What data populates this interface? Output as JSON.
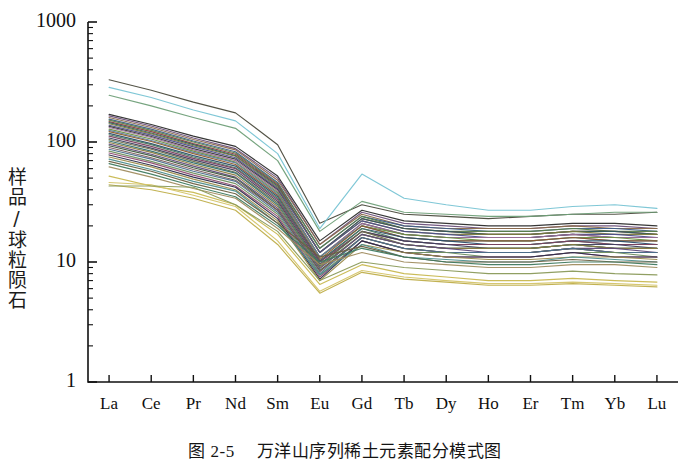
{
  "figure": {
    "caption_label": "图 2-5",
    "caption_text": "万洋山序列稀土元素配分模式图",
    "caption_full": "图 2-5　万洋山序列稀土元素配分模式图"
  },
  "chart_data": {
    "type": "line",
    "title": "",
    "xlabel": "",
    "ylabel": "样品/球粒陨石",
    "yscale": "log",
    "ylim": [
      1,
      1000
    ],
    "ytick_labels": [
      "1000",
      "100",
      "10",
      "1"
    ],
    "ytick_values": [
      1000,
      100,
      10,
      1
    ],
    "minor_ticks": true,
    "grid": false,
    "legend": "none",
    "categories": [
      "La",
      "Ce",
      "Pr",
      "Nd",
      "Sm",
      "Eu",
      "Gd",
      "Tb",
      "Dy",
      "Ho",
      "Er",
      "Tm",
      "Yb",
      "Lu"
    ],
    "series": [
      {
        "name": "S01",
        "color": "#4a4a3c",
        "values": [
          330,
          270,
          215,
          175,
          95,
          21,
          30,
          25,
          24,
          23,
          24,
          25,
          25,
          26
        ]
      },
      {
        "name": "S02",
        "color": "#78c4d4",
        "values": [
          285,
          235,
          185,
          150,
          80,
          19,
          54,
          34,
          30,
          27,
          27,
          29,
          30,
          28
        ]
      },
      {
        "name": "S03",
        "color": "#6f9f78",
        "values": [
          245,
          200,
          160,
          130,
          70,
          18,
          32,
          26,
          25,
          24,
          24,
          25,
          26,
          26
        ]
      },
      {
        "name": "S04",
        "color": "#2b2b2b",
        "values": [
          170,
          140,
          112,
          92,
          52,
          15,
          27,
          22,
          21,
          20,
          20,
          21,
          21,
          20
        ]
      },
      {
        "name": "S05",
        "color": "#6b4f7a",
        "values": [
          165,
          136,
          108,
          88,
          50,
          14,
          26,
          21,
          20,
          19,
          19,
          20,
          20,
          19
        ]
      },
      {
        "name": "S06",
        "color": "#8a6a4a",
        "values": [
          160,
          132,
          105,
          86,
          48,
          14,
          25,
          20,
          19,
          19,
          19,
          20,
          19,
          19
        ]
      },
      {
        "name": "S07",
        "color": "#3f5e8c",
        "values": [
          155,
          128,
          102,
          83,
          46,
          13,
          24,
          20,
          19,
          18,
          18,
          19,
          19,
          18
        ]
      },
      {
        "name": "S08",
        "color": "#5a7f4a",
        "values": [
          152,
          125,
          100,
          81,
          45,
          13,
          24,
          19,
          18,
          18,
          18,
          19,
          18,
          18
        ]
      },
      {
        "name": "S09",
        "color": "#8c3f3f",
        "values": [
          148,
          122,
          97,
          79,
          44,
          12,
          23,
          19,
          18,
          17,
          17,
          18,
          18,
          17
        ]
      },
      {
        "name": "S10",
        "color": "#2f5f5f",
        "values": [
          145,
          119,
          95,
          77,
          43,
          12,
          23,
          19,
          18,
          17,
          17,
          18,
          18,
          17
        ]
      },
      {
        "name": "S11",
        "color": "#7a7a3c",
        "values": [
          142,
          117,
          93,
          76,
          42,
          12,
          22,
          18,
          17,
          17,
          17,
          18,
          17,
          17
        ]
      },
      {
        "name": "S12",
        "color": "#4f4f8c",
        "values": [
          138,
          114,
          91,
          74,
          41,
          12,
          22,
          18,
          17,
          16,
          16,
          17,
          17,
          16
        ]
      },
      {
        "name": "S13",
        "color": "#3c3c3c",
        "values": [
          135,
          111,
          88,
          72,
          40,
          11,
          21,
          17,
          16,
          16,
          16,
          17,
          16,
          16
        ]
      },
      {
        "name": "S14",
        "color": "#9a6f9a",
        "values": [
          132,
          109,
          86,
          70,
          39,
          11,
          21,
          17,
          16,
          16,
          16,
          17,
          16,
          16
        ]
      },
      {
        "name": "S15",
        "color": "#6b8f3f",
        "values": [
          128,
          106,
          84,
          68,
          38,
          11,
          20,
          17,
          16,
          15,
          15,
          16,
          16,
          15
        ]
      },
      {
        "name": "S16",
        "color": "#5f7fa0",
        "values": [
          125,
          103,
          82,
          67,
          37,
          11,
          20,
          16,
          15,
          15,
          15,
          16,
          15,
          15
        ]
      },
      {
        "name": "S17",
        "color": "#8c5a2b",
        "values": [
          122,
          101,
          80,
          65,
          36,
          10.5,
          20,
          16,
          15,
          15,
          15,
          16,
          15,
          15
        ]
      },
      {
        "name": "S18",
        "color": "#2b4f6b",
        "values": [
          118,
          97,
          77,
          63,
          35,
          10.2,
          19,
          16,
          15,
          14,
          14,
          15,
          15,
          14
        ]
      },
      {
        "name": "S19",
        "color": "#4a7a5f",
        "values": [
          115,
          95,
          75,
          61,
          34,
          10,
          19,
          15,
          14,
          14,
          14,
          15,
          14,
          14
        ]
      },
      {
        "name": "S20",
        "color": "#7a3f5f",
        "values": [
          112,
          92,
          73,
          60,
          33,
          10,
          18,
          15,
          14,
          14,
          14,
          15,
          14,
          14
        ]
      },
      {
        "name": "S21",
        "color": "#3f3f5f",
        "values": [
          108,
          89,
          71,
          58,
          32,
          9.6,
          18,
          15,
          14,
          13,
          13,
          14,
          14,
          13
        ]
      },
      {
        "name": "S22",
        "color": "#6f6f4a",
        "values": [
          105,
          87,
          69,
          56,
          31,
          9.4,
          18,
          14,
          13,
          13,
          13,
          14,
          13,
          13
        ]
      },
      {
        "name": "S23",
        "color": "#2f6f6f",
        "values": [
          102,
          84,
          67,
          55,
          30,
          9.2,
          17,
          14,
          13,
          13,
          13,
          14,
          13,
          13
        ]
      },
      {
        "name": "S24",
        "color": "#8c7a3f",
        "values": [
          99,
          82,
          65,
          53,
          29,
          9,
          17,
          14,
          13,
          13,
          13,
          14,
          13,
          13
        ]
      },
      {
        "name": "S25",
        "color": "#5f4a7a",
        "values": [
          96,
          79,
          63,
          51,
          28,
          8.8,
          17,
          14,
          13,
          12,
          12,
          13,
          13,
          12
        ]
      },
      {
        "name": "S26",
        "color": "#3c5a3c",
        "values": [
          93,
          77,
          61,
          50,
          27,
          8.5,
          16,
          13,
          12,
          12,
          12,
          13,
          12,
          12
        ]
      },
      {
        "name": "S27",
        "color": "#7a5a5a",
        "values": [
          90,
          74,
          59,
          48,
          27,
          8.3,
          16,
          13,
          12,
          12,
          12,
          13,
          12,
          12
        ]
      },
      {
        "name": "S28",
        "color": "#4a6f8c",
        "values": [
          87,
          72,
          57,
          47,
          26,
          8,
          16,
          13,
          12,
          12,
          12,
          13,
          12,
          12
        ]
      },
      {
        "name": "S29",
        "color": "#6f8f5f",
        "values": [
          84,
          69,
          55,
          45,
          25,
          7.8,
          15,
          12,
          12,
          11,
          11,
          12,
          12,
          11
        ]
      },
      {
        "name": "S30",
        "color": "#8c4a6f",
        "values": [
          81,
          67,
          53,
          43,
          24,
          7.5,
          15,
          12,
          11,
          11,
          11,
          12,
          11,
          11
        ]
      },
      {
        "name": "S31",
        "color": "#2b2b4a",
        "values": [
          78,
          64,
          51,
          42,
          23,
          7.2,
          15,
          12,
          11,
          11,
          11,
          12,
          11,
          11
        ]
      },
      {
        "name": "S32",
        "color": "#9a8a4a",
        "values": [
          75,
          62,
          49,
          40,
          22,
          7,
          14,
          12,
          11,
          10.5,
          10.5,
          11,
          11,
          10.5
        ]
      },
      {
        "name": "S33",
        "color": "#4a8c8c",
        "values": [
          72,
          59,
          47,
          39,
          21,
          7.8,
          14,
          11,
          10.5,
          10,
          10,
          11,
          10.5,
          10
        ]
      },
      {
        "name": "S34",
        "color": "#6b5f3f",
        "values": [
          69,
          57,
          45,
          37,
          21,
          11,
          13.5,
          11,
          10,
          10,
          10,
          10.5,
          10,
          10
        ]
      },
      {
        "name": "S35",
        "color": "#3f7a5f",
        "values": [
          66,
          54,
          43,
          35,
          20,
          10,
          13,
          11,
          10,
          9.5,
          9.5,
          10,
          10,
          9.5
        ]
      },
      {
        "name": "S36",
        "color": "#a08c5f",
        "values": [
          62,
          51,
          41,
          34,
          19,
          9.5,
          12,
          10,
          9.5,
          9,
          9,
          9.5,
          9.5,
          9
        ]
      },
      {
        "name": "S37",
        "color": "#c8b850",
        "values": [
          52,
          43,
          38,
          30,
          17,
          6.5,
          9.5,
          8,
          7.5,
          7,
          7,
          7.3,
          7,
          6.8
        ]
      },
      {
        "name": "S38",
        "color": "#d4c468",
        "values": [
          46,
          44,
          36,
          29,
          15,
          5.7,
          8.5,
          7.5,
          7,
          6.6,
          6.6,
          6.8,
          6.6,
          6.4
        ]
      },
      {
        "name": "S39",
        "color": "#bfae4a",
        "values": [
          44,
          40,
          34,
          27,
          14,
          5.5,
          8.2,
          7.2,
          6.8,
          6.4,
          6.4,
          6.6,
          6.4,
          6.2
        ]
      },
      {
        "name": "S40",
        "color": "#8a9a5a",
        "values": [
          43,
          43,
          42,
          30,
          18,
          7,
          10,
          9,
          8.5,
          8,
          8,
          8.4,
          8,
          7.8
        ]
      }
    ]
  },
  "axes": {
    "plot_left_px": 88,
    "plot_right_px": 678,
    "plot_top_px": 22,
    "plot_bottom_px": 382
  }
}
